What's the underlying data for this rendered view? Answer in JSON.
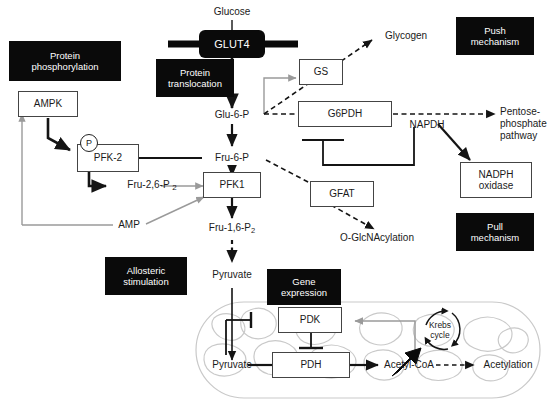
{
  "figure": {
    "width": 558,
    "height": 407,
    "colors": {
      "black_box_bg": "#0a0a0a",
      "black_box_text": "#ffffff",
      "line_black": "#141414",
      "line_gray": "#9a9a9a",
      "organelle_gray": "#c9c9c9",
      "box_border": "#444444",
      "text": "#1a1a1a"
    }
  },
  "black_boxes": [
    {
      "id": "protein-phosphorylation",
      "line1": "Protein",
      "line2": "phosphorylation"
    },
    {
      "id": "protein-translocation",
      "line1": "Protein",
      "line2": "translocation"
    },
    {
      "id": "push-mechanism",
      "line1": "Push",
      "line2": "mechanism"
    },
    {
      "id": "pull-mechanism",
      "line1": "Pull",
      "line2": "mechanism"
    },
    {
      "id": "allosteric-stimulation",
      "line1": "Allosteric",
      "line2": "stimulation"
    },
    {
      "id": "gene-expression",
      "line1": "Gene",
      "line2": "expression"
    }
  ],
  "enzyme_boxes": [
    {
      "id": "ampk",
      "label": "AMPK"
    },
    {
      "id": "pfk2",
      "label": "PFK-2"
    },
    {
      "id": "pfk1",
      "label": "PFK1"
    },
    {
      "id": "gs",
      "label": "GS"
    },
    {
      "id": "g6pdh",
      "label": "G6PDH"
    },
    {
      "id": "gfat",
      "label": "GFAT"
    },
    {
      "id": "nadph-oxidase",
      "line1": "NADPH",
      "line2": "oxidase"
    },
    {
      "id": "pdk",
      "label": "PDK"
    },
    {
      "id": "pdh",
      "label": "PDH"
    }
  ],
  "membrane_protein": {
    "id": "glut4",
    "label": "GLUT4"
  },
  "phospho_marker": {
    "id": "phosphate-group",
    "label": "P"
  },
  "metabolites": [
    {
      "id": "glucose",
      "label": "Glucose"
    },
    {
      "id": "glu-6-p",
      "label": "Glu-6-P"
    },
    {
      "id": "fru-6-p",
      "label": "Fru-6-P"
    },
    {
      "id": "fru-1-6-p2",
      "label": "Fru-1,6-P",
      "sub": "2"
    },
    {
      "id": "fru-2-6-p2",
      "label": "Fru-2,6-P",
      "sub": "2"
    },
    {
      "id": "pyruvate-cytosol",
      "label": "Pyruvate"
    },
    {
      "id": "pyruvate-mito",
      "label": "Pyruvate"
    },
    {
      "id": "acetyl-coa",
      "label": "Acetyl-CoA"
    },
    {
      "id": "amp",
      "label": "AMP"
    },
    {
      "id": "napdh",
      "label": "NAPDH"
    },
    {
      "id": "glycogen",
      "label": "Glycogen"
    },
    {
      "id": "o-glcnacylation",
      "label": "O-GlcNAcylation"
    },
    {
      "id": "acetylation",
      "label": "Acetylation"
    }
  ],
  "outputs": {
    "pentose_phosphate_pathway": {
      "line1": "Pentose-",
      "line2": "phosphate",
      "line3": "pathway"
    }
  },
  "krebs_cycle": {
    "line1": "Krebs",
    "line2": "cycle"
  }
}
